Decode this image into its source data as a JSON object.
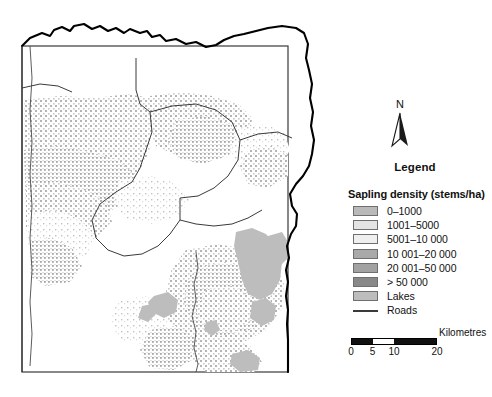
{
  "figure": {
    "type": "thematic-raster-map"
  },
  "map": {
    "background_color": "#ffffff",
    "frame_color": "#3a3a3a",
    "outer_boundary_color": "#000000",
    "district_boundary_color": "#3a3a3a",
    "road_color": "#4a4a4a"
  },
  "north_arrow": {
    "label": "N",
    "icon": "north-arrow-icon"
  },
  "legend": {
    "title": "Legend",
    "heading": "Sapling density (stems/ha)",
    "items": [
      {
        "label": "0–1000",
        "color": "#b9b9b9",
        "type": "swatch"
      },
      {
        "label": "1001–5000",
        "color": "#e4e4e4",
        "type": "swatch"
      },
      {
        "label": "5001–10 000",
        "color": "#efefef",
        "type": "swatch"
      },
      {
        "label": "10 001–20 000",
        "color": "#a9a9a9",
        "type": "swatch"
      },
      {
        "label": "20 001–50 000",
        "color": "#a2a2a2",
        "type": "swatch"
      },
      {
        "label": "> 50 000",
        "color": "#888888",
        "type": "swatch"
      },
      {
        "label": "Lakes",
        "color": "#bdbdbd",
        "type": "swatch"
      },
      {
        "label": "Roads",
        "color": "#3a3a3a",
        "type": "line"
      }
    ]
  },
  "scalebar": {
    "caption": "Kilometres",
    "ticks": [
      "0",
      "5",
      "10",
      "20"
    ],
    "segments": [
      {
        "fill": "dark"
      },
      {
        "fill": "light"
      },
      {
        "fill": "dark"
      }
    ]
  }
}
